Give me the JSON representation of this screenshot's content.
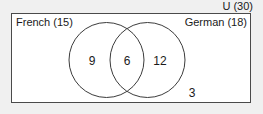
{
  "diagram": {
    "type": "venn-2-set",
    "universe": {
      "label": "U (30)",
      "total": 30
    },
    "sets": [
      {
        "name": "French",
        "label": "French (15)",
        "total": 15
      },
      {
        "name": "German",
        "label": "German (18)",
        "total": 18
      }
    ],
    "regions": [
      {
        "name": "french-only",
        "value": "9"
      },
      {
        "name": "both",
        "value": "6"
      },
      {
        "name": "german-only",
        "value": "12"
      },
      {
        "name": "neither",
        "value": "3"
      }
    ],
    "colors": {
      "background": "#f0f0f0",
      "universe_fill": "#ffffff",
      "universe_border": "#4a4a4a",
      "circle_stroke": "#3c3c3c",
      "text": "#1a1a1a"
    }
  }
}
